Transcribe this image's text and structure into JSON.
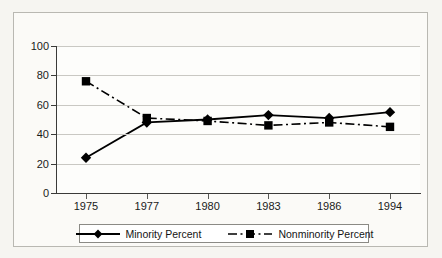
{
  "chart_data": {
    "type": "line",
    "title": "",
    "subtitle": "",
    "xlabel": "",
    "ylabel": "",
    "categories": [
      "1975",
      "1977",
      "1980",
      "1983",
      "1986",
      "1994"
    ],
    "ylim": [
      0,
      100
    ],
    "yticks": [
      0,
      20,
      40,
      60,
      80,
      100
    ],
    "grid": true,
    "legend_position": "bottom",
    "series": [
      {
        "name": "Minority Percent",
        "marker": "diamond",
        "linestyle": "solid",
        "color": "#000000",
        "values": [
          24,
          48,
          50,
          53,
          51,
          55
        ]
      },
      {
        "name": "Nonminority Percent",
        "marker": "square",
        "linestyle": "dash-dot",
        "color": "#000000",
        "values": [
          76,
          51,
          49,
          46,
          48,
          45
        ]
      }
    ]
  },
  "legend": {
    "entries": [
      {
        "label": "Minority Percent"
      },
      {
        "label": "Nonminority Percent"
      }
    ]
  },
  "axis": {
    "y_tick_labels": [
      "100",
      "80",
      "60",
      "40",
      "20",
      "0"
    ],
    "x_tick_labels": [
      "1975",
      "1977",
      "1980",
      "1983",
      "1986",
      "1994"
    ]
  },
  "colors": {
    "series_line": "#000000",
    "gridline": "#c9c8c3",
    "axis": "#3a3a38",
    "figure_background": "#f6f5f1",
    "plot_background": "#fdfdfb",
    "frame_border": "#b9b8b2"
  }
}
